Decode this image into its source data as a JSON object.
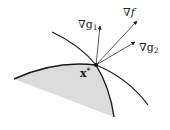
{
  "diagram": {
    "type": "kkt-gradient-cone",
    "colors": {
      "region_fill": "#dcdcdc",
      "curve": "#1a1a1a",
      "arrow": "#333333",
      "background": "#ffffff"
    },
    "point": {
      "label": "x",
      "superscript": "*",
      "x": 96,
      "y": 65
    },
    "vectors": [
      {
        "id": "grad-g1",
        "nabla": "∇",
        "name": "g",
        "subscript": "1",
        "tip": [
          100,
          25
        ]
      },
      {
        "id": "grad-f",
        "nabla": "∇",
        "name": "f",
        "subscript": "",
        "tip": [
          137,
          20
        ]
      },
      {
        "id": "grad-g2",
        "nabla": "∇",
        "name": "g",
        "subscript": "2",
        "tip": [
          136,
          42
        ]
      }
    ],
    "feasible_region": {
      "label": "",
      "shaded": true
    }
  }
}
